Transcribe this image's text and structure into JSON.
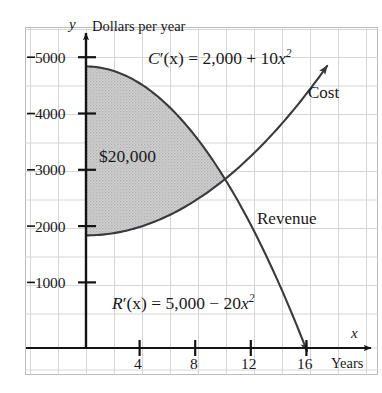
{
  "chart_data": {
    "type": "line",
    "title": "",
    "xlabel": "Years",
    "ylabel": "Dollars per year",
    "xlim": [
      -2,
      21
    ],
    "ylim": [
      -600,
      5600
    ],
    "grid": true,
    "legend_position": "inline-annotations",
    "x_ticks": [
      4,
      8,
      12,
      16
    ],
    "x_tick_labels": [
      "4",
      "8",
      "12",
      "16"
    ],
    "y_ticks": [
      1000,
      2000,
      3000,
      4000,
      5000
    ],
    "y_tick_labels": [
      "1000",
      "2000",
      "3000",
      "4000",
      "5000"
    ],
    "series": [
      {
        "name": "Cost",
        "equation": "C'(x) = 2,000 + 10x^2",
        "formula_display": "C′(x) = 2,000 + 10x²",
        "type": "quadratic",
        "a": 10,
        "c": 2000,
        "x": [
          0,
          2,
          4,
          6,
          8,
          10,
          12,
          14,
          16,
          17.3
        ],
        "values": [
          2000,
          2040,
          2160,
          2360,
          2640,
          3000,
          3440,
          3960,
          4560,
          4993
        ]
      },
      {
        "name": "Revenue",
        "equation": "R'(x) = 5,000 - 20x^2",
        "formula_display": "R′(x) = 5,000 − 20x²",
        "type": "quadratic",
        "a": -20,
        "c": 5000,
        "x": [
          0,
          2,
          4,
          6,
          8,
          10,
          12,
          14,
          15.8
        ],
        "values": [
          5000,
          4920,
          4680,
          4280,
          3720,
          3000,
          2120,
          1080,
          10
        ]
      }
    ],
    "intersection": {
      "x": 10,
      "y": 3000
    },
    "shaded_region": {
      "label": "$20,000",
      "between": [
        "Revenue",
        "Cost"
      ],
      "x_from": 0,
      "x_to": 10,
      "fill_color": "#c9c9c9",
      "value": 20000
    }
  },
  "axes": {
    "y_axis_symbol": "y",
    "x_axis_symbol": "x",
    "y_axis_title": "Dollars per year",
    "x_axis_title": "Years"
  },
  "tick_labels": {
    "y": [
      "5000",
      "4000",
      "3000",
      "2000",
      "1000"
    ],
    "x": [
      "4",
      "8",
      "12",
      "16"
    ]
  },
  "annotations": {
    "cost_equation_lead": "C",
    "cost_equation_body": "′(x) = 2,000 + 10",
    "cost_equation_var": "x",
    "cost_equation_exp": "2",
    "revenue_equation_lead": "R",
    "revenue_equation_body": "′(x) = 5,000 − 20",
    "revenue_equation_var": "x",
    "revenue_equation_exp": "2",
    "cost_curve_label": "Cost",
    "revenue_curve_label": "Revenue",
    "area_label": "$20,000"
  },
  "colors": {
    "grid": "#d5d5d7",
    "frame": "#b9b9bb",
    "axis": "#141416",
    "curve": "#3a3a3e",
    "shade": "#c9c9c9",
    "text": "#19191b",
    "background": "#ffffff"
  }
}
